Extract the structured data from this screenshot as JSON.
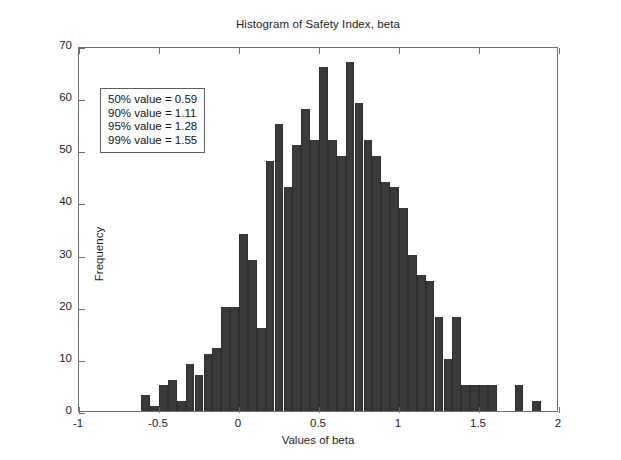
{
  "chart_data": {
    "type": "bar",
    "title": "Histogram of Safety Index, beta",
    "xlabel": "Values of beta",
    "ylabel": "Frequency",
    "xlim": [
      -1,
      2
    ],
    "ylim": [
      0,
      70
    ],
    "xticks": [
      -1,
      -0.5,
      0,
      0.5,
      1,
      1.5,
      2
    ],
    "xtick_labels": [
      "-1",
      "-0.5",
      "0",
      "0.5",
      "1",
      "1.5",
      "2"
    ],
    "yticks": [
      0,
      10,
      20,
      30,
      40,
      50,
      60,
      70
    ],
    "ytick_labels": [
      "0",
      "10",
      "20",
      "30",
      "40",
      "50",
      "60",
      "70"
    ],
    "grid": false,
    "legend": null,
    "bar_color": "#3a3a3a",
    "bin_width": 0.0555,
    "bin_centers": [
      -0.583,
      -0.528,
      -0.472,
      -0.417,
      -0.361,
      -0.306,
      -0.25,
      -0.194,
      -0.139,
      -0.083,
      -0.028,
      0.028,
      0.083,
      0.139,
      0.194,
      0.25,
      0.306,
      0.361,
      0.417,
      0.472,
      0.528,
      0.583,
      0.639,
      0.694,
      0.75,
      0.806,
      0.861,
      0.917,
      0.972,
      1.028,
      1.083,
      1.139,
      1.194,
      1.25,
      1.306,
      1.361,
      1.417,
      1.472,
      1.528,
      1.583,
      1.639,
      1.75,
      1.861
    ],
    "values": [
      3,
      1,
      5,
      6,
      2,
      9,
      7,
      11,
      12,
      20,
      20,
      34,
      29,
      16,
      48,
      55,
      43,
      51,
      58,
      52,
      66,
      52,
      49,
      67,
      59,
      52,
      49,
      44,
      43,
      39,
      30,
      26,
      25,
      18,
      10,
      18,
      5,
      5,
      5,
      5,
      0,
      5,
      2
    ]
  },
  "annotation": {
    "lines": [
      "50% value = 0.59",
      "90% value = 1.11",
      "95% value = 1.28",
      "99% value = 1.55"
    ]
  }
}
